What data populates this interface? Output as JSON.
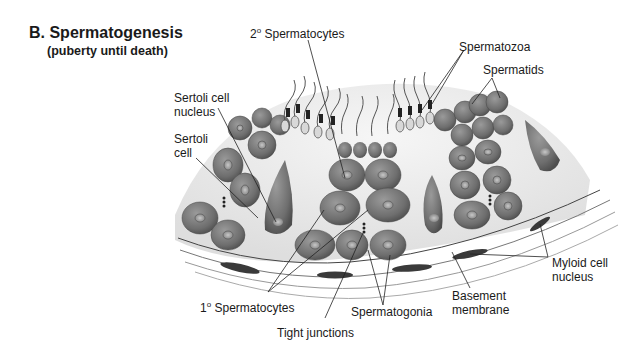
{
  "figure": {
    "title": "B.  Spermatogenesis",
    "subtitle": "(puberty until death)"
  },
  "labels": {
    "secondary_spermatocytes": {
      "prefix": "2",
      "sup": "o",
      "text": " Spermatocytes"
    },
    "spermatozoa": "Spermatozoa",
    "spermatids": "Spermatids",
    "sertoli_cell_nucleus_line1": "Sertoli cell",
    "sertoli_cell_nucleus_line2": "nucleus",
    "sertoli_cell_line1": "Sertoli",
    "sertoli_cell_line2": "cell",
    "primary_spermatocytes": {
      "prefix": "1",
      "sup": "o",
      "text": " Spermatocytes"
    },
    "spermatogonia": "Spermatogonia",
    "tight_junctions": "Tight junctions",
    "basement_membrane_line1": "Basement",
    "basement_membrane_line2": "membrane",
    "myloid_cell_nucleus_line1": "Myloid cell",
    "myloid_cell_nucleus_line2": "nucleus"
  },
  "colors": {
    "cell_fill": "#7a7a7a",
    "cell_dark": "#555555",
    "lumen": "#e6e6e6",
    "nucleus": "#a8a8a8",
    "line": "#222222",
    "membrane": "#444444"
  }
}
